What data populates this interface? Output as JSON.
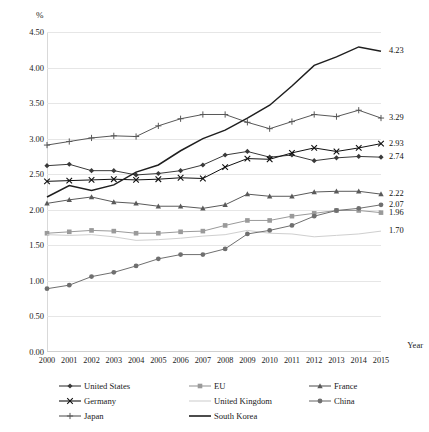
{
  "chart_data": {
    "type": "line",
    "title": "",
    "xlabel": "Year",
    "ylabel": "%",
    "ylim": [
      0,
      4.5
    ],
    "ytick_step": 0.5,
    "grid": true,
    "legend_position": "bottom",
    "categories": [
      "2000",
      "2001",
      "2002",
      "2003",
      "2004",
      "2005",
      "2006",
      "2007",
      "2008",
      "2009",
      "2010",
      "2011",
      "2012",
      "2013",
      "2014",
      "2015"
    ],
    "ytick_labels": [
      "4.50",
      "4.00",
      "3.50",
      "3.00",
      "2.50",
      "2.00",
      "1.50",
      "1.00",
      "0.50",
      "0.00"
    ],
    "ytick_values": [
      4.5,
      4.0,
      3.5,
      3.0,
      2.5,
      2.0,
      1.5,
      1.0,
      0.5,
      0.0
    ],
    "series": [
      {
        "name": "United States",
        "marker": "diamond",
        "color": "#3a3a3a",
        "end_label": "2.74",
        "values": [
          2.62,
          2.64,
          2.55,
          2.55,
          2.49,
          2.51,
          2.55,
          2.63,
          2.77,
          2.82,
          2.74,
          2.77,
          2.69,
          2.73,
          2.75,
          2.74
        ]
      },
      {
        "name": "EU",
        "marker": "square",
        "color": "#9a9a9a",
        "end_label": "1.96",
        "values": [
          1.67,
          1.69,
          1.71,
          1.7,
          1.67,
          1.67,
          1.69,
          1.7,
          1.78,
          1.85,
          1.85,
          1.91,
          1.95,
          1.99,
          1.99,
          1.96
        ]
      },
      {
        "name": "France",
        "marker": "triangle",
        "color": "#5a5a5a",
        "end_label": "2.22",
        "values": [
          2.09,
          2.14,
          2.18,
          2.11,
          2.09,
          2.05,
          2.05,
          2.02,
          2.07,
          2.22,
          2.19,
          2.19,
          2.25,
          2.26,
          2.26,
          2.22
        ]
      },
      {
        "name": "Germany",
        "marker": "x",
        "color": "#111111",
        "end_label": "2.93",
        "values": [
          2.4,
          2.41,
          2.42,
          2.43,
          2.42,
          2.43,
          2.45,
          2.44,
          2.6,
          2.72,
          2.71,
          2.8,
          2.87,
          2.82,
          2.87,
          2.93
        ]
      },
      {
        "name": "United Kingdom",
        "marker": "line",
        "color": "#cfcfcf",
        "end_label": "1.70",
        "values": [
          1.65,
          1.64,
          1.65,
          1.62,
          1.57,
          1.58,
          1.6,
          1.63,
          1.65,
          1.71,
          1.67,
          1.66,
          1.62,
          1.64,
          1.66,
          1.7
        ]
      },
      {
        "name": "China",
        "marker": "circle",
        "color": "#6f6f6f",
        "end_label": "2.07",
        "values": [
          0.89,
          0.94,
          1.06,
          1.12,
          1.21,
          1.31,
          1.37,
          1.37,
          1.45,
          1.66,
          1.71,
          1.78,
          1.91,
          1.99,
          2.02,
          2.07
        ]
      },
      {
        "name": "Japan",
        "marker": "plus",
        "color": "#585858",
        "end_label": "3.29",
        "values": [
          2.91,
          2.96,
          3.01,
          3.04,
          3.03,
          3.18,
          3.28,
          3.34,
          3.34,
          3.23,
          3.14,
          3.24,
          3.34,
          3.31,
          3.4,
          3.29
        ]
      },
      {
        "name": "South Korea",
        "marker": "none",
        "color": "#1f1f1f",
        "end_label": "4.23",
        "values": [
          2.18,
          2.34,
          2.27,
          2.35,
          2.53,
          2.63,
          2.83,
          3.0,
          3.12,
          3.29,
          3.47,
          3.74,
          4.03,
          4.15,
          4.29,
          4.23
        ]
      }
    ]
  },
  "legend": {
    "rows": [
      [
        {
          "label": "United States",
          "marker": "diamond",
          "color": "#3a3a3a"
        },
        {
          "label": "EU",
          "marker": "square",
          "color": "#9a9a9a"
        },
        {
          "label": "France",
          "marker": "triangle",
          "color": "#5a5a5a"
        }
      ],
      [
        {
          "label": "Germany",
          "marker": "x",
          "color": "#111111"
        },
        {
          "label": "United Kingdom",
          "marker": "line",
          "color": "#cfcfcf"
        },
        {
          "label": "China",
          "marker": "circle",
          "color": "#6f6f6f"
        }
      ],
      [
        {
          "label": "Japan",
          "marker": "plus",
          "color": "#585858"
        },
        {
          "label": "South Korea",
          "marker": "none",
          "color": "#1f1f1f"
        }
      ]
    ]
  }
}
